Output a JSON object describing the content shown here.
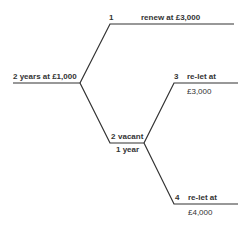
{
  "diagram": {
    "type": "decision-tree",
    "line_color": "#333333",
    "root": {
      "label": "2 years at £1,000"
    },
    "nodes": [
      {
        "id": "1",
        "number": "1",
        "label": "renew at £3,000"
      },
      {
        "id": "2",
        "number": "2",
        "label": "vacant",
        "sublabel": "1 year"
      },
      {
        "id": "3",
        "number": "3",
        "label": "re-let at",
        "sublabel": "£3,000"
      },
      {
        "id": "4",
        "number": "4",
        "label": "re-let at",
        "sublabel": "£4,000"
      }
    ]
  }
}
